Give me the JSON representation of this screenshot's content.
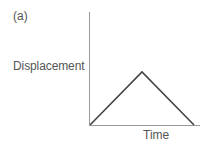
{
  "chart_data": {
    "type": "line",
    "panel_label": "(a)",
    "title": "",
    "xlabel": "Time",
    "ylabel": "Displacement",
    "grid": false,
    "legend": null,
    "ticks": false,
    "x": [
      0,
      0.5,
      1
    ],
    "series": [
      {
        "name": "displacement",
        "values": [
          0,
          1,
          0
        ]
      }
    ],
    "colors": {
      "line": "#444444",
      "axes": "#999999",
      "text": "#555555"
    }
  }
}
